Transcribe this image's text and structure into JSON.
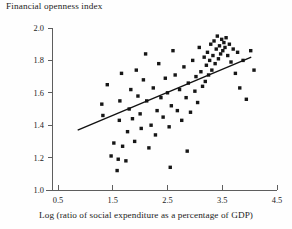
{
  "chart_data": {
    "type": "scatter",
    "title": "Financial openness index",
    "xlabel": "Log (ratio of social expenditure as a percentage of GDP)",
    "ylabel": "Financial openness index",
    "xlim": [
      0.0,
      4.75
    ],
    "ylim": [
      0.95,
      2.05
    ],
    "xticks": [
      0.5,
      1.5,
      2.5,
      3.5,
      4.5
    ],
    "xtick_labels": [
      "0.5",
      "1.5",
      "2.5",
      "3.5",
      "4.5"
    ],
    "yticks": [
      1.0,
      1.2,
      1.4,
      1.6,
      1.8,
      2.0
    ],
    "ytick_labels": [
      "1.0",
      "1.2",
      "1.4",
      "1.6",
      "1.8",
      "2.0"
    ],
    "grid": false,
    "legend": null,
    "marker": "filled-square",
    "marker_color": "#161616",
    "trend_line": {
      "color": "#111111",
      "x": [
        0.86,
        4.03
      ],
      "y": [
        1.37,
        1.82
      ]
    },
    "points": [
      [
        1.3,
        1.53
      ],
      [
        1.32,
        1.46
      ],
      [
        1.47,
        1.21
      ],
      [
        1.52,
        1.29
      ],
      [
        1.58,
        1.12
      ],
      [
        1.6,
        1.19
      ],
      [
        1.62,
        1.43
      ],
      [
        1.63,
        1.55
      ],
      [
        1.66,
        1.72
      ],
      [
        1.68,
        1.27
      ],
      [
        1.74,
        1.18
      ],
      [
        1.77,
        1.36
      ],
      [
        1.8,
        1.5
      ],
      [
        1.83,
        1.62
      ],
      [
        1.86,
        1.44
      ],
      [
        1.9,
        1.3
      ],
      [
        1.93,
        1.74
      ],
      [
        1.96,
        1.58
      ],
      [
        2.0,
        1.47
      ],
      [
        2.02,
        1.38
      ],
      [
        2.06,
        1.68
      ],
      [
        2.1,
        1.84
      ],
      [
        2.12,
        1.55
      ],
      [
        2.16,
        1.26
      ],
      [
        2.2,
        1.4
      ],
      [
        2.24,
        1.63
      ],
      [
        2.28,
        1.34
      ],
      [
        2.31,
        1.49
      ],
      [
        2.34,
        1.78
      ],
      [
        2.38,
        1.57
      ],
      [
        2.42,
        1.45
      ],
      [
        2.46,
        1.69
      ],
      [
        2.5,
        1.6
      ],
      [
        2.53,
        1.39
      ],
      [
        2.57,
        1.52
      ],
      [
        2.6,
        1.86
      ],
      [
        2.64,
        1.71
      ],
      [
        2.68,
        1.49
      ],
      [
        2.72,
        1.62
      ],
      [
        2.76,
        1.43
      ],
      [
        2.8,
        1.76
      ],
      [
        2.84,
        1.57
      ],
      [
        2.88,
        1.66
      ],
      [
        2.92,
        1.48
      ],
      [
        2.96,
        1.8
      ],
      [
        3.0,
        1.61
      ],
      [
        3.02,
        1.7
      ],
      [
        3.05,
        1.54
      ],
      [
        3.08,
        1.88
      ],
      [
        3.11,
        1.73
      ],
      [
        3.14,
        1.64
      ],
      [
        3.17,
        1.82
      ],
      [
        3.19,
        1.67
      ],
      [
        3.21,
        1.77
      ],
      [
        3.23,
        1.85
      ],
      [
        3.25,
        1.71
      ],
      [
        3.27,
        1.8
      ],
      [
        3.29,
        1.9
      ],
      [
        3.31,
        1.74
      ],
      [
        3.33,
        1.83
      ],
      [
        3.35,
        1.92
      ],
      [
        3.37,
        1.78
      ],
      [
        3.39,
        1.87
      ],
      [
        3.41,
        1.95
      ],
      [
        3.43,
        1.81
      ],
      [
        3.45,
        1.89
      ],
      [
        3.47,
        1.84
      ],
      [
        3.49,
        1.93
      ],
      [
        3.51,
        1.86
      ],
      [
        3.53,
        1.91
      ],
      [
        3.55,
        1.88
      ],
      [
        3.57,
        1.94
      ],
      [
        3.6,
        1.83
      ],
      [
        3.63,
        1.9
      ],
      [
        3.66,
        1.79
      ],
      [
        3.7,
        1.87
      ],
      [
        3.74,
        1.72
      ],
      [
        3.78,
        1.85
      ],
      [
        3.82,
        1.63
      ],
      [
        3.88,
        1.8
      ],
      [
        3.94,
        1.56
      ],
      [
        4.02,
        1.86
      ],
      [
        4.08,
        1.74
      ],
      [
        2.55,
        1.14
      ],
      [
        2.86,
        1.24
      ],
      [
        1.4,
        1.65
      ]
    ]
  }
}
